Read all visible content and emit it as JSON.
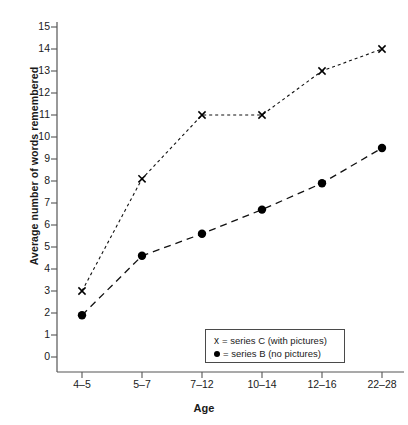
{
  "chart_data": {
    "type": "line",
    "title": "",
    "xlabel": "Age",
    "ylabel": "Average number of words remembered",
    "categories": [
      "4–5",
      "5–7",
      "7–12",
      "10–14",
      "12–16",
      "22–28"
    ],
    "yticks": [
      0,
      1,
      2,
      3,
      4,
      5,
      6,
      7,
      8,
      9,
      10,
      11,
      12,
      13,
      14,
      15
    ],
    "ylim": [
      0,
      15
    ],
    "grid": false,
    "legend_position": "inside-bottom-right",
    "series": [
      {
        "name": "series C (with pictures)",
        "marker": "x",
        "linestyle": "dotted",
        "values": [
          3.0,
          8.1,
          11.0,
          11.0,
          13.0,
          14.0
        ]
      },
      {
        "name": "series B (no pictures)",
        "marker": "filled-circle",
        "linestyle": "dashed",
        "values": [
          1.9,
          4.6,
          5.6,
          6.7,
          7.9,
          9.5
        ]
      }
    ]
  },
  "legend": {
    "rows": [
      {
        "marker_label": "x",
        "text": "= series C (with pictures)"
      },
      {
        "marker_label": "●",
        "text": "= series B (no pictures)"
      }
    ]
  }
}
